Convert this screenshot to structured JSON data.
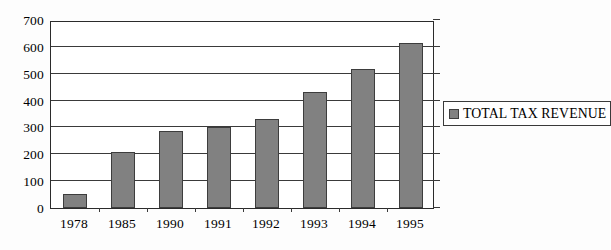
{
  "chart_data": {
    "type": "bar",
    "title": "",
    "xlabel": "",
    "ylabel": "",
    "categories": [
      "1978",
      "1985",
      "1990",
      "1991",
      "1992",
      "1993",
      "1994",
      "1995"
    ],
    "values": [
      52,
      209,
      288,
      303,
      333,
      432,
      518,
      614
    ],
    "series": [
      {
        "name": "TOTAL TAX REVENUE",
        "values": [
          52,
          209,
          288,
          303,
          333,
          432,
          518,
          614
        ]
      }
    ],
    "ylim": [
      0,
      700
    ],
    "ytick_step": 100,
    "yticks": [
      "700",
      "600",
      "500",
      "400",
      "300",
      "200",
      "100",
      "0"
    ],
    "grid": true,
    "legend_position": "right",
    "legend_entries": [
      "TOTAL TAX REVENUE"
    ],
    "bar_color": "#818181",
    "bar_border_color": "#3d3d3d",
    "axis_color": "#3a3a3a",
    "background_color": "#ffffff"
  },
  "legend": {
    "label": "TOTAL TAX REVENUE",
    "swatch_name": "legend-color-swatch"
  }
}
